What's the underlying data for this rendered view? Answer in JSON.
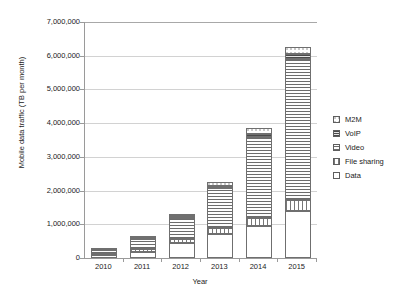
{
  "chart_data": {
    "type": "bar",
    "subtype": "stacked-bar",
    "title": "",
    "xlabel": "Year",
    "ylabel": "Mobile data traffic (TB per month)",
    "categories": [
      "2010",
      "2011",
      "2012",
      "2013",
      "2014",
      "2015"
    ],
    "ylim": [
      0,
      7000000
    ],
    "ytick_values": [
      0,
      1000000,
      2000000,
      3000000,
      4000000,
      5000000,
      6000000,
      7000000
    ],
    "ytick_labels": [
      "0",
      "1,000,000",
      "2,000,000",
      "3,000,000",
      "4,000,000",
      "5,000,000",
      "6,000,000",
      "7,000,000"
    ],
    "grid": true,
    "legend_position": "right",
    "series": [
      {
        "name": "Data",
        "pattern": "solid-white",
        "values": [
          90000,
          190000,
          440000,
          700000,
          940000,
          1400000
        ]
      },
      {
        "name": "File sharing",
        "pattern": "vertical-lines",
        "values": [
          40000,
          80000,
          130000,
          190000,
          260000,
          330000
        ]
      },
      {
        "name": "Video",
        "pattern": "horizontal-lines",
        "values": [
          100000,
          290000,
          620000,
          1180000,
          2380000,
          4180000
        ]
      },
      {
        "name": "VoIP",
        "pattern": "dense-horizontal-lines",
        "values": [
          15000,
          25000,
          45000,
          65000,
          90000,
          130000
        ]
      },
      {
        "name": "M2M",
        "pattern": "dotted",
        "values": [
          5000,
          16000,
          65000,
          115000,
          180000,
          210000
        ]
      }
    ],
    "totals": [
      250000,
      601000,
      1300000,
      2250000,
      3850000,
      6250000
    ],
    "annotations": []
  },
  "legend": {
    "items": [
      {
        "label": "M2M",
        "swatch": "dotted-swatch"
      },
      {
        "label": "VoIP",
        "swatch": "dense-lines-swatch"
      },
      {
        "label": "Video",
        "swatch": "horizontal-lines-swatch"
      },
      {
        "label": "File sharing",
        "swatch": "vertical-lines-swatch"
      },
      {
        "label": "Data",
        "swatch": "white-swatch"
      }
    ]
  }
}
